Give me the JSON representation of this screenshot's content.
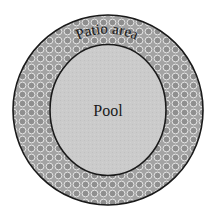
{
  "diagram": {
    "type": "concentric-circles",
    "outer_region": {
      "label": "Patio area",
      "fill_pattern": "circles",
      "colors": {
        "base": "#9a9a9a",
        "dot": "#8c8c8c",
        "dot_outline": "#e6e6e6",
        "stroke": "#1a1a1a"
      }
    },
    "inner_region": {
      "label": "Pool",
      "colors": {
        "fill": "#c9c9c9",
        "stroke": "#1a1a1a"
      }
    }
  }
}
